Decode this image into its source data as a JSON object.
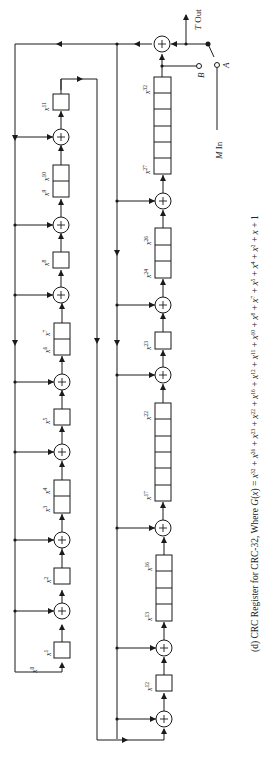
{
  "diagram": {
    "title": "CRC Register for CRC-32",
    "caption": {
      "prefix": "(d)  CRC Register for CRC-32, Where ",
      "polynomial_text": "G(x) = x^32 + x^26 + x^23 + x^22 + x^16 + x^12 + x^11 + x^10 + x^8 + x^7 + x^5 + x^4 + x^2 + x + 1",
      "g_label": "G(x) = ",
      "terms": [
        "32",
        "26",
        "23",
        "22",
        "16",
        "12",
        "11",
        "10",
        "8",
        "7",
        "5",
        "4",
        "2",
        "1",
        "0"
      ]
    },
    "io_labels": {
      "output": "T Out",
      "switch_b": "B",
      "switch_a": "A",
      "input": "M In"
    },
    "left_chain": {
      "labels": [
        {
          "base": "x",
          "exp": "0"
        },
        {
          "base": "x",
          "exp": "1"
        },
        {
          "base": "x",
          "exp": "2"
        },
        {
          "base": "x",
          "exp": "3"
        },
        {
          "base": "x",
          "exp": "4"
        },
        {
          "base": "x",
          "exp": "5"
        },
        {
          "base": "x",
          "exp": "6"
        },
        {
          "base": "x",
          "exp": "7"
        },
        {
          "base": "x",
          "exp": "8"
        },
        {
          "base": "x",
          "exp": "9"
        },
        {
          "base": "x",
          "exp": "10"
        },
        {
          "base": "x",
          "exp": "11"
        }
      ]
    },
    "right_chain": {
      "labels": [
        {
          "base": "x",
          "exp": "12"
        },
        {
          "base": "x",
          "exp": "13"
        },
        {
          "base": "x",
          "exp": "16"
        },
        {
          "base": "x",
          "exp": "17"
        },
        {
          "base": "x",
          "exp": "22"
        },
        {
          "base": "x",
          "exp": "23"
        },
        {
          "base": "x",
          "exp": "24"
        },
        {
          "base": "x",
          "exp": "26"
        },
        {
          "base": "x",
          "exp": "27"
        },
        {
          "base": "x",
          "exp": "32"
        }
      ]
    },
    "xor_symbol": "+",
    "colors": {
      "line": "#1a1a1a",
      "background": "#ffffff"
    }
  }
}
